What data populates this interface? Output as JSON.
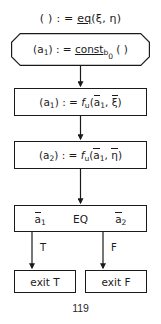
{
  "diagram": {
    "type": "flowchart",
    "page_number": "119",
    "header": {
      "text": "( ) : = eq(ξ, η)",
      "lhs": "( )",
      "assign": ": =",
      "operator": "eq",
      "operator_underlined": true,
      "args": "(ξ, η)"
    },
    "nodes": [
      {
        "id": "const",
        "shape": "notched-rectangle",
        "text": "(a₁) : = const_b₀ ( )",
        "lhs": "(a",
        "lhs_sub": "1",
        "lhs_close": ")",
        "assign": ": =",
        "op": "const",
        "op_sub": "b",
        "op_subsub": "0",
        "args": "( )"
      },
      {
        "id": "fu1",
        "shape": "rectangle",
        "text": "(a₁) : = f_u(ā₁, ξ̄)",
        "lhs": "(a",
        "lhs_sub": "1",
        "lhs_close": ")",
        "assign": ": =",
        "fn": "f",
        "fn_sub": "u",
        "arg1": "a",
        "arg1_sub": "1",
        "arg2": "ξ"
      },
      {
        "id": "fu2",
        "shape": "rectangle",
        "text": "(a₂) : = f_u(ā₁, η̄)",
        "lhs": "(a",
        "lhs_sub": "2",
        "lhs_close": ")",
        "assign": ": =",
        "fn": "f",
        "fn_sub": "u",
        "arg1": "a",
        "arg1_sub": "1",
        "arg2": "η"
      },
      {
        "id": "eq",
        "shape": "rectangle",
        "text": "ā₁ EQ ā₂",
        "left_operand": "a",
        "left_sub": "1",
        "comparator": "EQ",
        "right_operand": "a",
        "right_sub": "2"
      },
      {
        "id": "exit-t",
        "shape": "rectangle",
        "text": "exit T"
      },
      {
        "id": "exit-f",
        "shape": "rectangle",
        "text": "exit  F"
      }
    ],
    "edges": [
      {
        "from": "const",
        "to": "fu1",
        "label": ""
      },
      {
        "from": "fu1",
        "to": "fu2",
        "label": ""
      },
      {
        "from": "fu2",
        "to": "eq",
        "label": ""
      },
      {
        "from": "eq",
        "to": "exit-t",
        "label": "T"
      },
      {
        "from": "eq",
        "to": "exit-f",
        "label": "F"
      }
    ],
    "edge_labels": {
      "true": "T",
      "false": "F"
    },
    "colors": {
      "ink": "#1a1a1a",
      "background": "#ffffff"
    }
  }
}
